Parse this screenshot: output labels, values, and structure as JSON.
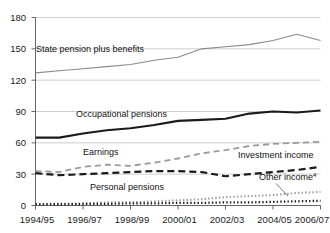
{
  "chart_data": {
    "type": "line",
    "title": "",
    "xlabel": "",
    "ylabel": "",
    "grid": true,
    "legend_position": "inline-labels",
    "ylim": [
      0,
      180
    ],
    "yticks": [
      0,
      30,
      60,
      90,
      120,
      150,
      180
    ],
    "ytick_labels": [
      "0",
      "30",
      "60",
      "90",
      "120",
      "150",
      "180"
    ],
    "x": [
      "1994/95",
      "1995/96",
      "1996/97",
      "1997/98",
      "1998/99",
      "1999/00",
      "2000/01",
      "2001/02",
      "2002/03",
      "2003/04",
      "2004/05",
      "2005/06",
      "2006/07"
    ],
    "xtick_labels": [
      "1994/95",
      "1996/97",
      "1998/99",
      "2000/01",
      "2002/03",
      "2004/05",
      "2006/07"
    ],
    "xtick_indices": [
      0,
      2,
      4,
      6,
      8,
      10,
      12
    ],
    "series": [
      {
        "name": "State pension plus benefits",
        "style": "solid",
        "color": "#8a8a8a",
        "width": 1.1,
        "values": [
          127,
          129,
          131,
          133,
          135,
          139,
          142,
          150,
          152,
          154,
          158,
          164,
          158
        ],
        "label_x": 36,
        "label_y": 52
      },
      {
        "name": "Occupational pensions",
        "style": "solid",
        "color": "#1a1a1a",
        "width": 2.1,
        "values": [
          65,
          65,
          69,
          72,
          74,
          77,
          81,
          82,
          83,
          88,
          90,
          89,
          91
        ],
        "label_x": 76,
        "label_y": 117
      },
      {
        "name": "Earnings",
        "style": "dashed",
        "color": "#9a9a9a",
        "width": 1.8,
        "values": [
          33,
          32,
          37,
          39,
          38,
          41,
          45,
          50,
          53,
          57,
          59,
          60,
          61
        ],
        "label_x": 83,
        "label_y": 155
      },
      {
        "name": "Investment income",
        "style": "dashed",
        "color": "#1a1a1a",
        "width": 2.2,
        "values": [
          31,
          29,
          30,
          31,
          32,
          33,
          33,
          32,
          28,
          30,
          32,
          34,
          37
        ],
        "label_x": 238,
        "label_y": 158
      },
      {
        "name": "Personal pensions",
        "style": "dotted",
        "color": "#9a9a9a",
        "width": 2.0,
        "values": [
          1,
          2,
          2,
          3,
          3,
          4,
          5,
          6,
          8,
          9,
          10,
          12,
          13
        ],
        "label_x": 90,
        "label_y": 190
      },
      {
        "name": "Other income",
        "superscript": "4",
        "style": "dotted",
        "color": "#1a1a1a",
        "width": 2.2,
        "values": [
          1,
          1,
          1.5,
          1.5,
          2,
          2,
          2.5,
          2.5,
          3,
          3,
          3.5,
          4,
          4.5
        ],
        "label_x": 259,
        "label_y": 180
      }
    ]
  },
  "labels": {
    "state_pension": "State pension plus benefits",
    "occupational": "Occupational pensions",
    "earnings": "Earnings",
    "investment": "Investment income",
    "personal": "Personal pensions",
    "other": "Other income",
    "other_sup": "4"
  },
  "y_axis": {
    "t0": "0",
    "t30": "30",
    "t60": "60",
    "t90": "90",
    "t120": "120",
    "t150": "150",
    "t180": "180"
  },
  "x_axis": {
    "t1": "1994/95",
    "t2": "1996/97",
    "t3": "1998/99",
    "t4": "2000/01",
    "t5": "2002/03",
    "t6": "2004/05",
    "t7": "2006/07"
  }
}
